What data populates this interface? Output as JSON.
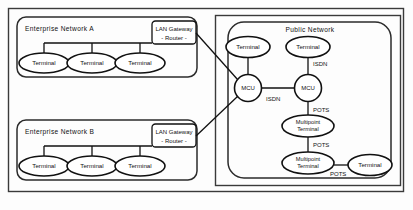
{
  "diagram": {
    "groups": {
      "enterprise_a": {
        "label": "Enterprise Network A",
        "terminals": [
          {
            "label": "Terminal"
          },
          {
            "label": "Terminal"
          },
          {
            "label": "Terminal"
          }
        ],
        "gateway": {
          "line1": "LAN Gateway",
          "line2": "- Router -"
        }
      },
      "enterprise_b": {
        "label": "Enterprise Network B",
        "terminals": [
          {
            "label": "Terminal"
          },
          {
            "label": "Terminal"
          },
          {
            "label": "Terminal"
          }
        ],
        "gateway": {
          "line1": "LAN Gateway",
          "line2": "- Router -"
        }
      },
      "public_network": {
        "label": "Public Network",
        "nodes": {
          "terminal_left": {
            "label": "Terminal"
          },
          "terminal_right": {
            "label": "Terminal"
          },
          "mcu_left": {
            "label": "MCU"
          },
          "mcu_right": {
            "label": "MCU"
          },
          "multipoint_upper": {
            "line1": "Multipoint",
            "line2": "Terminal"
          },
          "multipoint_lower": {
            "line1": "Multipoint",
            "line2": "Terminal"
          },
          "terminal_bottom": {
            "label": "Terminal"
          }
        }
      }
    },
    "link_labels": {
      "isdn_mcu_to_mcu": "ISDN",
      "isdn_terminal_right": "ISDN",
      "pots_mcu_right": "POTS",
      "pots_multipoint_chain": "POTS",
      "pots_terminal_bottom": "POTS"
    },
    "colors": {
      "stroke": "#111111",
      "frame": "#3a3a3a",
      "background": "#fdfdfd",
      "node_fill": "#ffffff"
    }
  }
}
